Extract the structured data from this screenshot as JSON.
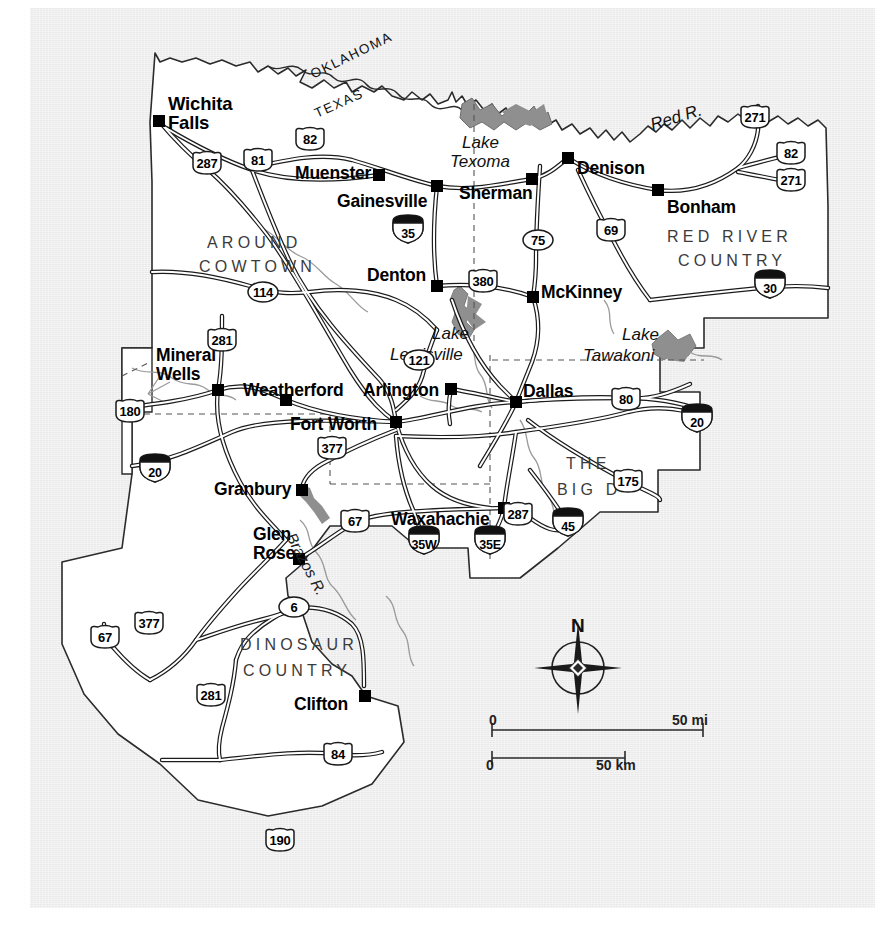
{
  "map": {
    "title": "North Central Texas regional road map",
    "background_color": "#e9e9e9",
    "land_color": "#ffffff",
    "water_color": "#8d8d8d",
    "cities": [
      {
        "name": "Wichita\nFalls",
        "line1": "Wichita",
        "line2": "Falls",
        "x": 168,
        "y": 94,
        "dot_x": 159,
        "dot_y": 121,
        "size": "city-18"
      },
      {
        "name": "Muenster",
        "line1": "Muenster",
        "line2": "",
        "x": 295,
        "y": 164,
        "dot_x": 379,
        "dot_y": 175,
        "size": "city-17"
      },
      {
        "name": "Gainesville",
        "line1": "Gainesville",
        "line2": "",
        "x": 337,
        "y": 192,
        "dot_x": 437,
        "dot_y": 186,
        "size": "city-17"
      },
      {
        "name": "Sherman",
        "line1": "Sherman",
        "line2": "",
        "x": 459,
        "y": 184,
        "dot_x": 532,
        "dot_y": 179,
        "size": "city-17"
      },
      {
        "name": "Denison",
        "line1": "Denison",
        "line2": "",
        "x": 577,
        "y": 159,
        "dot_x": 568,
        "dot_y": 158,
        "size": "city-17"
      },
      {
        "name": "Bonham",
        "line1": "Bonham",
        "line2": "",
        "x": 667,
        "y": 198,
        "dot_x": 658,
        "dot_y": 190,
        "size": "city-17"
      },
      {
        "name": "Denton",
        "line1": "Denton",
        "line2": "",
        "x": 367,
        "y": 266,
        "dot_x": 437,
        "dot_y": 286,
        "size": "city-17"
      },
      {
        "name": "McKinney",
        "line1": "McKinney",
        "line2": "",
        "x": 541,
        "y": 283,
        "dot_x": 533,
        "dot_y": 297,
        "size": "city-17"
      },
      {
        "name": "Mineral\nWells",
        "line1": "Mineral",
        "line2": "Wells",
        "x": 156,
        "y": 346,
        "dot_x": 218,
        "dot_y": 390,
        "size": "city-17"
      },
      {
        "name": "Weatherford",
        "line1": "Weatherford",
        "line2": "",
        "x": 243,
        "y": 381,
        "dot_x": 286,
        "dot_y": 400,
        "size": "city-17"
      },
      {
        "name": "Arlington",
        "line1": "Arlington",
        "line2": "",
        "x": 363,
        "y": 381,
        "dot_x": 451,
        "dot_y": 389,
        "size": "city-17"
      },
      {
        "name": "Fort Worth",
        "line1": "Fort Worth",
        "line2": "",
        "x": 290,
        "y": 415,
        "dot_x": 396,
        "dot_y": 422,
        "size": "city-17"
      },
      {
        "name": "Dallas",
        "line1": "Dallas",
        "line2": "",
        "x": 523,
        "y": 382,
        "dot_x": 516,
        "dot_y": 402,
        "size": "city-17"
      },
      {
        "name": "Granbury",
        "line1": "Granbury",
        "line2": "",
        "x": 214,
        "y": 480,
        "dot_x": 302,
        "dot_y": 490,
        "size": "city-17"
      },
      {
        "name": "Glen\nRose",
        "line1": "Glen",
        "line2": "Rose",
        "x": 253,
        "y": 525,
        "dot_x": 299,
        "dot_y": 559,
        "size": "city-17"
      },
      {
        "name": "Waxahachie",
        "line1": "Waxahachie",
        "line2": "",
        "x": 391,
        "y": 510,
        "dot_x": 504,
        "dot_y": 508,
        "size": "city-17"
      },
      {
        "name": "Clifton",
        "line1": "Clifton",
        "line2": "",
        "x": 294,
        "y": 695,
        "dot_x": 365,
        "dot_y": 696,
        "size": "city-17"
      }
    ],
    "regions": [
      {
        "label": "AROUND",
        "x": 207,
        "y": 234
      },
      {
        "label": "COWTOWN",
        "x": 199,
        "y": 258
      },
      {
        "label": "RED RIVER",
        "x": 667,
        "y": 228
      },
      {
        "label": "COUNTRY",
        "x": 678,
        "y": 252
      },
      {
        "label": "THE",
        "x": 566,
        "y": 455
      },
      {
        "label": "BIG  D",
        "x": 557,
        "y": 481
      },
      {
        "label": "DINOSAUR",
        "x": 240,
        "y": 636
      },
      {
        "label": "COUNTRY",
        "x": 243,
        "y": 662
      }
    ],
    "water_labels": [
      {
        "label": "Lake",
        "x": 462,
        "y": 133,
        "cls": "water"
      },
      {
        "label": "Texoma",
        "x": 450,
        "y": 152,
        "cls": "water"
      },
      {
        "label": "Lake",
        "x": 432,
        "y": 324,
        "cls": "water"
      },
      {
        "label": "Lewisville",
        "x": 390,
        "y": 345,
        "cls": "water"
      },
      {
        "label": "Lake",
        "x": 622,
        "y": 325,
        "cls": "water"
      },
      {
        "label": "Tawakoni",
        "x": 583,
        "y": 346,
        "cls": "water"
      },
      {
        "label": "Red R.",
        "x": 648,
        "y": 116,
        "cls": "water"
      },
      {
        "label": "Brazos R.",
        "x": 298,
        "y": 530,
        "cls": "water-sm"
      }
    ],
    "state_borders": [
      {
        "label": "OKLAHOMA",
        "x": 308,
        "y": 68,
        "rot": -26
      },
      {
        "label": "TEXAS",
        "x": 312,
        "y": 107,
        "rot": -24
      }
    ],
    "highway_shields": [
      {
        "id": "287",
        "type": "us",
        "x": 207,
        "y": 163
      },
      {
        "id": "81",
        "type": "us",
        "x": 258,
        "y": 160
      },
      {
        "id": "82",
        "type": "us",
        "x": 310,
        "y": 139
      },
      {
        "id": "271",
        "type": "us",
        "x": 755,
        "y": 117
      },
      {
        "id": "82",
        "type": "us",
        "x": 791,
        "y": 153
      },
      {
        "id": "271",
        "type": "us",
        "x": 791,
        "y": 180
      },
      {
        "id": "35",
        "type": "interstate",
        "x": 408,
        "y": 229
      },
      {
        "id": "75",
        "type": "state",
        "x": 538,
        "y": 240
      },
      {
        "id": "69",
        "type": "us",
        "x": 611,
        "y": 230
      },
      {
        "id": "114",
        "type": "state",
        "x": 263,
        "y": 292
      },
      {
        "id": "380",
        "type": "us",
        "x": 483,
        "y": 281
      },
      {
        "id": "30",
        "type": "interstate",
        "x": 770,
        "y": 284
      },
      {
        "id": "281",
        "type": "us",
        "x": 222,
        "y": 340
      },
      {
        "id": "121",
        "type": "state",
        "x": 419,
        "y": 360
      },
      {
        "id": "180",
        "type": "us",
        "x": 130,
        "y": 411
      },
      {
        "id": "80",
        "type": "us",
        "x": 626,
        "y": 399
      },
      {
        "id": "20",
        "type": "interstate",
        "x": 697,
        "y": 418
      },
      {
        "id": "377",
        "type": "us",
        "x": 332,
        "y": 448
      },
      {
        "id": "20",
        "type": "interstate",
        "x": 155,
        "y": 468
      },
      {
        "id": "175",
        "type": "us",
        "x": 628,
        "y": 481
      },
      {
        "id": "67",
        "type": "us",
        "x": 355,
        "y": 521
      },
      {
        "id": "287",
        "type": "us",
        "x": 518,
        "y": 514
      },
      {
        "id": "45",
        "type": "interstate",
        "x": 568,
        "y": 522
      },
      {
        "id": "35W",
        "type": "interstate",
        "x": 424,
        "y": 540
      },
      {
        "id": "35E",
        "type": "interstate",
        "x": 490,
        "y": 540
      },
      {
        "id": "6",
        "type": "state",
        "x": 294,
        "y": 607
      },
      {
        "id": "67",
        "type": "us",
        "x": 105,
        "y": 637
      },
      {
        "id": "377",
        "type": "us",
        "x": 149,
        "y": 623
      },
      {
        "id": "281",
        "type": "us",
        "x": 211,
        "y": 695
      },
      {
        "id": "84",
        "type": "us",
        "x": 338,
        "y": 754
      },
      {
        "id": "190",
        "type": "us",
        "x": 280,
        "y": 840
      }
    ],
    "legend": {
      "compass_north_label": "N",
      "scale_miles_zero": "0",
      "scale_miles_max": "50 mi",
      "scale_km_zero": "0",
      "scale_km_max": "50 km"
    }
  }
}
